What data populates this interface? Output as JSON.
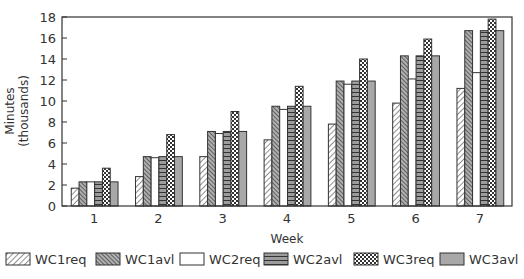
{
  "chart_data": {
    "type": "bar",
    "title": "",
    "xlabel": "Week",
    "ylabel": "Minutes (thousands)",
    "ylabel_lines": [
      "Minutes",
      "(thousands)"
    ],
    "ylim": [
      0,
      18
    ],
    "yticks": [
      0,
      2,
      4,
      6,
      8,
      10,
      12,
      14,
      16,
      18
    ],
    "categories": [
      "1",
      "2",
      "3",
      "4",
      "5",
      "6",
      "7"
    ],
    "grid": false,
    "legend_position": "bottom",
    "series": [
      {
        "name": "WC1req",
        "pattern": "diag-light",
        "values": [
          1.7,
          2.8,
          4.7,
          6.3,
          7.8,
          9.8,
          11.2
        ]
      },
      {
        "name": "WC1avl",
        "pattern": "diag-dark",
        "values": [
          2.3,
          4.7,
          7.1,
          9.5,
          11.9,
          14.3,
          16.7
        ]
      },
      {
        "name": "WC2req",
        "pattern": "white",
        "values": [
          2.3,
          4.6,
          6.9,
          9.2,
          11.6,
          12.1,
          12.7
        ]
      },
      {
        "name": "WC2avl",
        "pattern": "horiz",
        "values": [
          2.3,
          4.7,
          7.1,
          9.5,
          11.9,
          14.3,
          16.7
        ]
      },
      {
        "name": "WC3req",
        "pattern": "checker",
        "values": [
          3.6,
          6.8,
          9.0,
          11.4,
          14.0,
          15.9,
          17.8
        ]
      },
      {
        "name": "WC3avl",
        "pattern": "gray",
        "values": [
          2.3,
          4.7,
          7.1,
          9.5,
          11.9,
          14.3,
          16.7
        ]
      }
    ]
  },
  "colors": {
    "axis": "#333333",
    "bar_stroke": "#333333",
    "gray_fill": "#a8a8a8",
    "dark_hatch_bg": "#9a9a9a"
  }
}
